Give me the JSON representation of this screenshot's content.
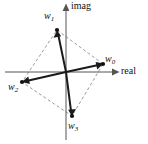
{
  "figure": {
    "width": 148,
    "height": 144,
    "background_color": "#ffffff"
  },
  "axes": {
    "horizontal": {
      "name": "real-axis",
      "label": "real",
      "color": "#555555",
      "x_start": 5,
      "x_end": 118,
      "y": 72,
      "arrow": "right"
    },
    "vertical": {
      "name": "imag-axis",
      "label": "imag",
      "color": "#555555",
      "x": 66,
      "y_start": 140,
      "y_end": 4,
      "arrow": "up"
    },
    "origin": {
      "x": 66,
      "y": 72
    }
  },
  "vectors": [
    {
      "id": "w0",
      "label": "w",
      "subscript": "0",
      "tip": {
        "x": 103,
        "y": 64
      },
      "label_pos": {
        "x": 105,
        "y": 54
      },
      "color": "#1a1a1a"
    },
    {
      "id": "w1",
      "label": "w",
      "subscript": "1",
      "tip": {
        "x": 57,
        "y": 30
      },
      "label_pos": {
        "x": 44,
        "y": 11
      },
      "color": "#1a1a1a"
    },
    {
      "id": "w2",
      "label": "w",
      "subscript": "2",
      "tip": {
        "x": 22,
        "y": 82
      },
      "label_pos": {
        "x": 8,
        "y": 82
      },
      "color": "#1a1a1a"
    },
    {
      "id": "w3",
      "label": "w",
      "subscript": "3",
      "tip": {
        "x": 72,
        "y": 116
      },
      "label_pos": {
        "x": 68,
        "y": 121
      },
      "color": "#1a1a1a"
    }
  ],
  "dashed_polygon": {
    "name": "connecting-quadrilateral",
    "color": "#9a9a9a",
    "dash_pattern": "3 2.4",
    "points": "103,64 57,30 22,82 72,116 103,64"
  }
}
